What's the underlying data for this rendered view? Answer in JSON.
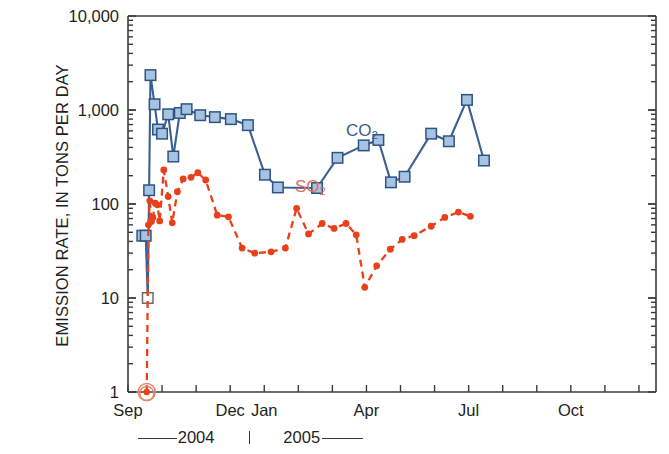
{
  "figure": {
    "background": "#ffffff",
    "axis_color": "#3b3b3b"
  },
  "chart_data": {
    "type": "line",
    "title": "",
    "subtitle": "",
    "xlabel": "",
    "ylabel": "EMISSION RATE, IN TONS PER DAY",
    "yscale": "log",
    "ylim": [
      1,
      10000
    ],
    "grid": false,
    "legend_position": "inline-annotation",
    "y_tick_labels": [
      "10,000",
      "1,000",
      "100",
      "10",
      "1"
    ],
    "y_tick_values": [
      10000,
      1000,
      100,
      10,
      1
    ],
    "x_tick_labels": [
      "Sep",
      "Dec",
      "Jan",
      "Apr",
      "Jul",
      "Oct"
    ],
    "x_tick_month_index": [
      0,
      3,
      4,
      7,
      10,
      13
    ],
    "x_axis_span_months": [
      0,
      15.5
    ],
    "year_bands": [
      "2004",
      "2005"
    ],
    "annotations": [
      {
        "name": "co2-annotation",
        "text": "CO",
        "sub": "2",
        "x_month": 6.4,
        "y_value": 600
      },
      {
        "name": "so2-annotation",
        "text": "SO",
        "sub": "2",
        "x_month": 4.9,
        "y_value": 150
      }
    ],
    "series": [
      {
        "name": "CO2",
        "label": "CO",
        "sublabel": "2",
        "color": "#3a5f92",
        "marker_fill": "#a6c4e2",
        "marker_edge": "#2e5582",
        "marker": "square",
        "linestyle": "solid",
        "points": [
          {
            "x": 0.42,
            "y": 46
          },
          {
            "x": 0.52,
            "y": 46
          },
          {
            "x": 0.58,
            "y": 10,
            "open_marker": true
          },
          {
            "x": 0.62,
            "y": 140
          },
          {
            "x": 0.66,
            "y": 2350
          },
          {
            "x": 0.78,
            "y": 1150
          },
          {
            "x": 0.88,
            "y": 620
          },
          {
            "x": 1.0,
            "y": 560
          },
          {
            "x": 1.18,
            "y": 900
          },
          {
            "x": 1.33,
            "y": 320
          },
          {
            "x": 1.52,
            "y": 930
          },
          {
            "x": 1.72,
            "y": 1020
          },
          {
            "x": 2.12,
            "y": 880
          },
          {
            "x": 2.55,
            "y": 840
          },
          {
            "x": 3.02,
            "y": 800
          },
          {
            "x": 3.52,
            "y": 690
          },
          {
            "x": 4.02,
            "y": 205
          },
          {
            "x": 4.4,
            "y": 150
          },
          {
            "x": 5.55,
            "y": 148
          },
          {
            "x": 6.15,
            "y": 310
          },
          {
            "x": 6.92,
            "y": 420
          },
          {
            "x": 7.35,
            "y": 480
          },
          {
            "x": 7.72,
            "y": 170
          },
          {
            "x": 8.12,
            "y": 195
          },
          {
            "x": 8.9,
            "y": 560
          },
          {
            "x": 9.42,
            "y": 465
          },
          {
            "x": 9.95,
            "y": 1280
          },
          {
            "x": 10.45,
            "y": 290
          }
        ]
      },
      {
        "name": "SO2",
        "label": "SO",
        "sublabel": "2",
        "color": "#e8401a",
        "marker_fill": "#e8401a",
        "marker_edge": "#e8401a",
        "marker": "circle",
        "linestyle": "dashed",
        "points": [
          {
            "x": 0.55,
            "y": 1,
            "circled": true
          },
          {
            "x": 0.6,
            "y": 60
          },
          {
            "x": 0.64,
            "y": 108
          },
          {
            "x": 0.69,
            "y": 65
          },
          {
            "x": 0.73,
            "y": 72
          },
          {
            "x": 0.8,
            "y": 102
          },
          {
            "x": 0.86,
            "y": 98
          },
          {
            "x": 0.93,
            "y": 66
          },
          {
            "x": 1.05,
            "y": 230
          },
          {
            "x": 1.18,
            "y": 120
          },
          {
            "x": 1.3,
            "y": 63
          },
          {
            "x": 1.45,
            "y": 135
          },
          {
            "x": 1.62,
            "y": 185
          },
          {
            "x": 1.85,
            "y": 192
          },
          {
            "x": 2.05,
            "y": 215
          },
          {
            "x": 2.28,
            "y": 180
          },
          {
            "x": 2.62,
            "y": 76
          },
          {
            "x": 2.95,
            "y": 73
          },
          {
            "x": 3.35,
            "y": 34
          },
          {
            "x": 3.72,
            "y": 30
          },
          {
            "x": 4.2,
            "y": 31
          },
          {
            "x": 4.62,
            "y": 34
          },
          {
            "x": 4.95,
            "y": 90
          },
          {
            "x": 5.3,
            "y": 48
          },
          {
            "x": 5.7,
            "y": 62
          },
          {
            "x": 6.05,
            "y": 55
          },
          {
            "x": 6.4,
            "y": 62
          },
          {
            "x": 6.7,
            "y": 47
          },
          {
            "x": 6.95,
            "y": 13
          },
          {
            "x": 7.3,
            "y": 22
          },
          {
            "x": 7.7,
            "y": 33
          },
          {
            "x": 8.05,
            "y": 42
          },
          {
            "x": 8.4,
            "y": 46
          },
          {
            "x": 8.9,
            "y": 58
          },
          {
            "x": 9.3,
            "y": 72
          },
          {
            "x": 9.7,
            "y": 82
          },
          {
            "x": 10.05,
            "y": 74
          }
        ]
      }
    ]
  }
}
